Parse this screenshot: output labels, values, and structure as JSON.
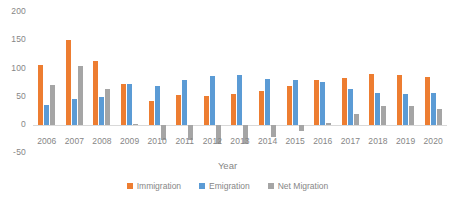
{
  "chart_data": {
    "type": "bar",
    "title": "",
    "xlabel": "Year",
    "ylabel": "",
    "categories": [
      "2006",
      "2007",
      "2008",
      "2009",
      "2010",
      "2011",
      "2012",
      "2013",
      "2014",
      "2015",
      "2016",
      "2017",
      "2018",
      "2019",
      "2020"
    ],
    "series": [
      {
        "name": "Immigration",
        "color": "#ED7D31",
        "values": [
          107,
          151,
          113,
          73,
          42,
          53,
          52,
          55,
          60,
          69,
          79,
          84,
          90,
          88,
          85
        ]
      },
      {
        "name": "Emigration",
        "color": "#5B9BD5",
        "values": [
          36,
          46,
          49,
          72,
          69,
          80,
          87,
          89,
          82,
          80,
          76,
          64,
          56,
          54,
          56
        ]
      },
      {
        "name": "Net Migration",
        "color": "#A5A5A5",
        "values": [
          71,
          104,
          63,
          1,
          -27,
          -27,
          -34,
          -33,
          -21,
          -11,
          3,
          19,
          34,
          33,
          28
        ]
      }
    ],
    "ylim": [
      -50,
      200
    ],
    "yticks": [
      200,
      150,
      100,
      50,
      0,
      -50
    ],
    "ytick_labels": [
      "200",
      "150",
      "100",
      "50",
      "0",
      "-50"
    ],
    "grid": false,
    "legend_position": "bottom",
    "axis_text_color": "#868686"
  }
}
